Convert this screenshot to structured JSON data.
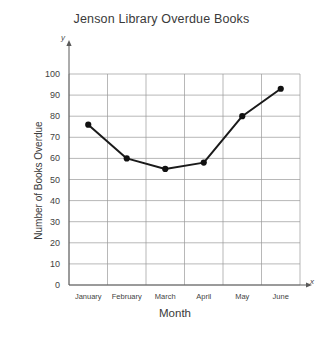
{
  "chart_data": {
    "type": "line",
    "title": "Jenson Library Overdue Books",
    "xlabel": "Month",
    "ylabel": "Number of Books Overdue",
    "x_axis_letter": "x",
    "y_axis_letter": "y",
    "categories": [
      "January",
      "February",
      "March",
      "April",
      "May",
      "June"
    ],
    "values": [
      76,
      60,
      55,
      58,
      80,
      93
    ],
    "series": [
      {
        "name": "Books Overdue",
        "values": [
          76,
          60,
          55,
          58,
          80,
          93
        ]
      }
    ],
    "ylim": [
      0,
      100
    ],
    "y_ticks": [
      0,
      10,
      20,
      30,
      40,
      50,
      60,
      70,
      80,
      90,
      100
    ],
    "y_tick_labels": [
      "0",
      "10",
      "20",
      "30",
      "40",
      "50",
      "60",
      "70",
      "80",
      "90",
      "100"
    ],
    "grid": true,
    "legend": "none",
    "line_color": "#1a1a1a",
    "marker_color": "#111111",
    "grid_color": "#9a9a9a",
    "axis_color": "#5a5a5a",
    "background_color": "#ffffff"
  }
}
